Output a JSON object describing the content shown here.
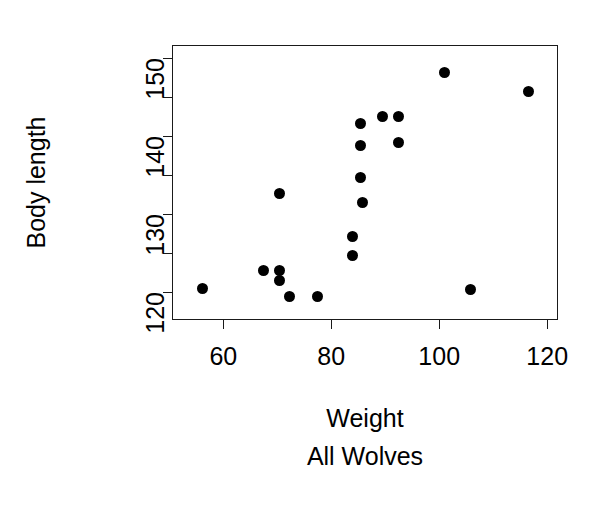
{
  "chart_data": {
    "type": "scatter",
    "title": "",
    "subtitle": "All Wolves",
    "xlabel": "Weight",
    "ylabel": "Body length",
    "xlim": [
      50.5,
      122.0
    ],
    "ylim": [
      116.4,
      151.6
    ],
    "grid": false,
    "legend": null,
    "x_ticks": [
      60,
      80,
      100,
      120
    ],
    "x_tick_labels": [
      "60",
      "80",
      "100",
      "120"
    ],
    "x_minor_ticks": [],
    "y_ticks": [
      120,
      125,
      130,
      135,
      140,
      145,
      150
    ],
    "y_tick_labels": [
      "120",
      "",
      "130",
      "",
      "140",
      "",
      "150"
    ],
    "y_labeled_ticks": [
      120,
      130,
      140,
      150
    ],
    "point_color": "#000000",
    "point_marker": "filled-circle",
    "axis_color": "#1a1a1a",
    "background_color": "#ffffff",
    "n_points": 19,
    "points": [
      {
        "x": 56.1,
        "y": 120.4
      },
      {
        "x": 67.4,
        "y": 122.8
      },
      {
        "x": 70.5,
        "y": 132.6
      },
      {
        "x": 70.5,
        "y": 122.8
      },
      {
        "x": 70.5,
        "y": 121.5
      },
      {
        "x": 72.3,
        "y": 119.4
      },
      {
        "x": 77.5,
        "y": 119.4
      },
      {
        "x": 84.0,
        "y": 127.1
      },
      {
        "x": 84.0,
        "y": 124.7
      },
      {
        "x": 85.5,
        "y": 141.5
      },
      {
        "x": 85.5,
        "y": 138.7
      },
      {
        "x": 85.5,
        "y": 134.6
      },
      {
        "x": 85.7,
        "y": 131.4
      },
      {
        "x": 89.4,
        "y": 142.4
      },
      {
        "x": 92.5,
        "y": 142.4
      },
      {
        "x": 92.5,
        "y": 139.1
      },
      {
        "x": 100.9,
        "y": 148.1
      },
      {
        "x": 105.8,
        "y": 120.3
      },
      {
        "x": 116.5,
        "y": 145.6
      }
    ]
  }
}
